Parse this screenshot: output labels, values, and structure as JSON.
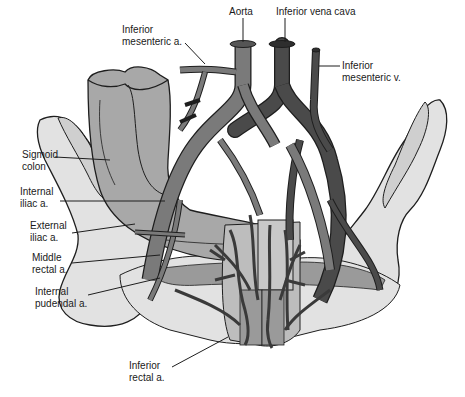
{
  "diagram": {
    "colors": {
      "artery": "#7a7a7a",
      "vein": "#4a4a4a",
      "colon": "#a8a8a8",
      "pelvis": "#e2e2e2",
      "outline": "#1e1e1e",
      "background": "#ffffff"
    },
    "labels": {
      "aorta": "Aorta",
      "ivc": "Inferior vena cava",
      "ima_1": "Inferior",
      "ima_2": "mesenteric a.",
      "imv_1": "Inferior",
      "imv_2": "mesenteric v.",
      "sigmoid_1": "Sigmoid",
      "sigmoid_2": "colon",
      "internal_iliac_1": "Internal",
      "internal_iliac_2": "iliac a.",
      "external_iliac_1": "External",
      "external_iliac_2": "iliac a.",
      "middle_rectal_1": "Middle",
      "middle_rectal_2": "rectal a.",
      "internal_pudendal_1": "Internal",
      "internal_pudendal_2": "pudendal a.",
      "inferior_rectal_1": "Inferior",
      "inferior_rectal_2": "rectal a."
    }
  }
}
